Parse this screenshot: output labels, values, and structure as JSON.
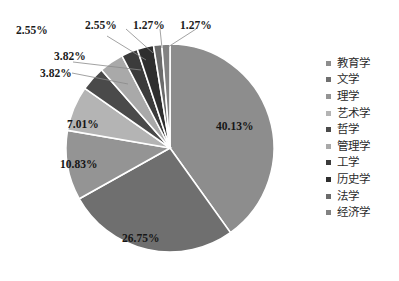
{
  "chart_data": {
    "type": "pie",
    "title": "",
    "subtitle": "",
    "xlabel": "",
    "ylabel": "",
    "grid": false,
    "legend_position": "right",
    "start_angle_deg": 0,
    "direction": "clockwise",
    "categories": [
      "教育学",
      "文学",
      "理学",
      "艺术学",
      "哲学",
      "管理学",
      "工学",
      "历史学",
      "法学",
      "经济学"
    ],
    "values": [
      40.13,
      26.75,
      10.83,
      7.01,
      3.82,
      3.82,
      2.55,
      2.55,
      1.27,
      1.27
    ],
    "value_labels": [
      "40.13%",
      "26.75%",
      "10.83%",
      "7.01%",
      "3.82%",
      "3.82%",
      "2.55%",
      "2.55%",
      "1.27%",
      "1.27%"
    ],
    "colors": [
      "#8d8d8d",
      "#6f6f6f",
      "#949494",
      "#b4b4b4",
      "#4a4a4a",
      "#a9a9a9",
      "#3b3b3b",
      "#2e2e2e",
      "#6b6b6b",
      "#828282"
    ],
    "slices": [
      {
        "label": "教育学",
        "value": 40.13,
        "value_label": "40.13%",
        "color": "#8d8d8d",
        "label_placement": "inside"
      },
      {
        "label": "文学",
        "value": 26.75,
        "value_label": "26.75%",
        "color": "#6f6f6f",
        "label_placement": "inside"
      },
      {
        "label": "理学",
        "value": 10.83,
        "value_label": "10.83%",
        "color": "#949494",
        "label_placement": "inside"
      },
      {
        "label": "艺术学",
        "value": 7.01,
        "value_label": "7.01%",
        "color": "#b4b4b4",
        "label_placement": "inside"
      },
      {
        "label": "哲学",
        "value": 3.82,
        "value_label": "3.82%",
        "color": "#4a4a4a",
        "label_placement": "outside"
      },
      {
        "label": "管理学",
        "value": 3.82,
        "value_label": "3.82%",
        "color": "#a9a9a9",
        "label_placement": "outside"
      },
      {
        "label": "工学",
        "value": 2.55,
        "value_label": "2.55%",
        "color": "#3b3b3b",
        "label_placement": "outside"
      },
      {
        "label": "历史学",
        "value": 2.55,
        "value_label": "2.55%",
        "color": "#2e2e2e",
        "label_placement": "outside"
      },
      {
        "label": "法学",
        "value": 1.27,
        "value_label": "1.27%",
        "color": "#6b6b6b",
        "label_placement": "outside"
      },
      {
        "label": "经济学",
        "value": 1.27,
        "value_label": "1.27%",
        "color": "#828282",
        "label_placement": "outside"
      }
    ]
  },
  "legend": {
    "items": [
      {
        "label": "教育学",
        "color": "#8d8d8d"
      },
      {
        "label": "文学",
        "color": "#6f6f6f"
      },
      {
        "label": "理学",
        "color": "#949494"
      },
      {
        "label": "艺术学",
        "color": "#b4b4b4"
      },
      {
        "label": "哲学",
        "color": "#4a4a4a"
      },
      {
        "label": "管理学",
        "color": "#a9a9a9"
      },
      {
        "label": "工学",
        "color": "#3b3b3b"
      },
      {
        "label": "历史学",
        "color": "#2e2e2e"
      },
      {
        "label": "法学",
        "color": "#6b6b6b"
      },
      {
        "label": "经济学",
        "color": "#828282"
      }
    ]
  },
  "labels": {
    "l0": "40.13%",
    "l1": "26.75%",
    "l2": "10.83%",
    "l3": "7.01%",
    "l4": "3.82%",
    "l5": "3.82%",
    "l6": "2.55%",
    "l7": "2.55%",
    "l8": "1.27%",
    "l9": "1.27%"
  }
}
